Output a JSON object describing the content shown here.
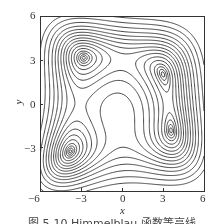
{
  "chart_data": {
    "type": "contour",
    "function": "Himmelblau f(x,y) = (x^2 + y - 11)^2 + (x + y^2 - 7)^2",
    "title": "",
    "xlabel": "x",
    "ylabel": "y",
    "xlim": [
      -6,
      6
    ],
    "ylim": [
      -6,
      6
    ],
    "x_ticks": [
      -6,
      -3,
      0,
      3,
      6
    ],
    "y_ticks": [
      -6,
      -3,
      0,
      3,
      6
    ],
    "x_tick_labels": [
      "−6",
      "−3",
      "0",
      "3",
      "6"
    ],
    "y_tick_labels": [
      "6",
      "3",
      "0",
      "−3",
      "−6"
    ],
    "minima": [
      {
        "x": -2.805,
        "y": 3.131
      },
      {
        "x": 3.0,
        "y": 2.0
      },
      {
        "x": 3.584,
        "y": -1.848
      },
      {
        "x": -3.779,
        "y": -3.283
      }
    ],
    "contour_levels": [
      0.5,
      2,
      5,
      10,
      20,
      35,
      55,
      80,
      110,
      150,
      200,
      260,
      340,
      450,
      600,
      800
    ],
    "grid": false,
    "legend": null,
    "line_color": "#333333"
  },
  "caption": "图 5-10  Himmelblau 函数等高线"
}
